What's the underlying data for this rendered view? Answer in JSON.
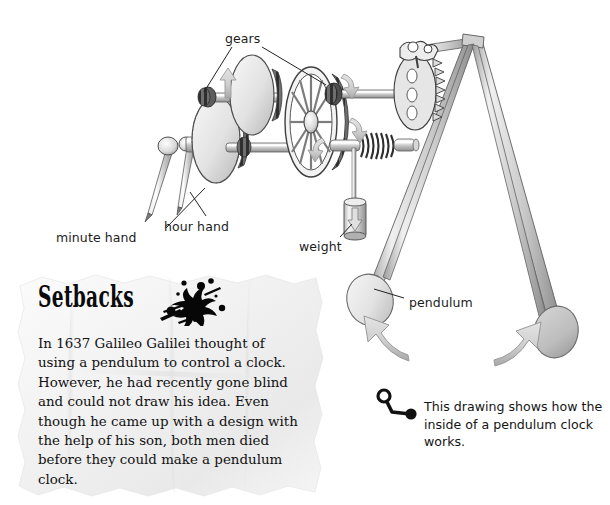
{
  "page": {
    "background_color": "#ffffff",
    "width": 610,
    "height": 505
  },
  "diagram": {
    "name": "pendulum-clock-cutaway",
    "labels": [
      {
        "id": "gears",
        "text": "gears",
        "x": 225,
        "y": 33
      },
      {
        "id": "hour-hand",
        "text": "hour hand",
        "x": 164,
        "y": 221
      },
      {
        "id": "minute-hand",
        "text": "minute hand",
        "x": 58,
        "y": 232
      },
      {
        "id": "weight",
        "text": "weight",
        "x": 301,
        "y": 241
      },
      {
        "id": "pendulum",
        "text": "pendulum",
        "x": 409,
        "y": 297
      }
    ],
    "colors": {
      "metal_light": "#e9e9e9",
      "metal_mid": "#bdbdbd",
      "metal_dark": "#7d7d7d",
      "outline": "#3d3d3d",
      "arrow_fill": "#d2d2d2",
      "arrow_stroke": "#9a9a9a",
      "leader_line": "#2b2b2b"
    }
  },
  "note": {
    "heading": "Setbacks",
    "body": "In 1637 Galileo Galilei thought of using a pendulum to control a clock. However, he had recently gone blind and could not draw his idea. Even though he came up with a design with the help of his son, both men died before they could make a pendulum clock.",
    "paper_color": "#f4f4f4",
    "ink_splat": "ink-splat-icon"
  },
  "caption": {
    "text": "This drawing shows how the inside of a pendulum clock works.",
    "marker": "pin-marker-icon"
  }
}
